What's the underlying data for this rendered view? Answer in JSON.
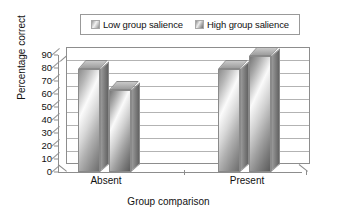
{
  "chart_data": {
    "type": "bar",
    "title": "",
    "xlabel": "Group comparison",
    "ylabel": "Percentage correct",
    "categories": [
      "Absent",
      "Present"
    ],
    "series": [
      {
        "name": "Low group salience",
        "values": [
          79,
          79
        ]
      },
      {
        "name": "High group salience",
        "values": [
          63,
          89
        ]
      }
    ],
    "ylim": [
      0,
      90
    ],
    "yticks": [
      0,
      10,
      20,
      30,
      40,
      50,
      60,
      70,
      80,
      90
    ],
    "ytick_labels": [
      "0",
      "10",
      "20",
      "30",
      "40",
      "50",
      "60",
      "70",
      "80",
      "90"
    ],
    "grid": true,
    "legend_position": "top-center",
    "style": "3d-grouped-bar",
    "colors": {
      "low_group_salience": "#d8d8d8",
      "high_group_salience": "#a0a0a0",
      "gridline": "#b3b3b3",
      "axis": "#8d8d8d",
      "background": "#ffffff",
      "text": "#111111"
    }
  },
  "legend": {
    "entries": [
      {
        "label": "Low group salience",
        "swatch": "bar-swatch-low-icon"
      },
      {
        "label": "High group salience",
        "swatch": "bar-swatch-high-icon"
      }
    ]
  },
  "axes": {
    "y_title": "Percentage correct",
    "x_title": "Group comparison",
    "y_ticks": [
      "90",
      "80",
      "70",
      "60",
      "50",
      "40",
      "30",
      "20",
      "10",
      "0"
    ],
    "x_ticks": [
      "Absent",
      "Present"
    ]
  }
}
